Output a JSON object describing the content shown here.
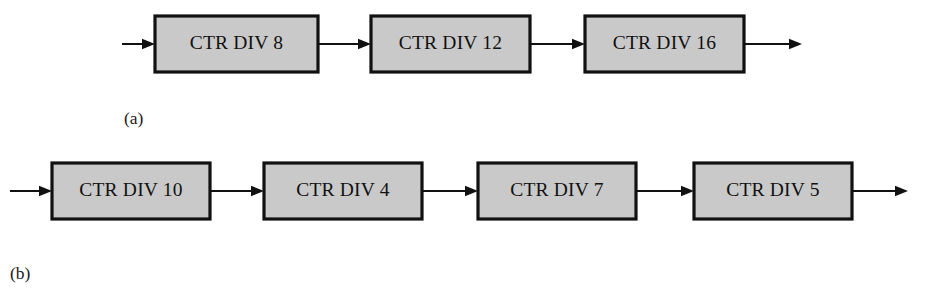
{
  "figure": {
    "background_color": "#ffffff",
    "block_fill_color": "#c9c9c9",
    "block_border_color": "#111111",
    "line_color": "#111111"
  },
  "panels": [
    {
      "caption": "(a)",
      "caption_x": 124,
      "caption_y": 120,
      "row_center_y": 44,
      "block_height": 56,
      "input_wire": {
        "x1": 122,
        "x2": 155
      },
      "output_wire": {
        "x1": 744,
        "x2": 802
      },
      "blocks": [
        {
          "label": "CTR DIV 8",
          "x": 155,
          "width": 163
        },
        {
          "label": "CTR DIV 12",
          "x": 371,
          "width": 159
        },
        {
          "label": "CTR DIV 16",
          "x": 585,
          "width": 159
        }
      ],
      "connectors": [
        {
          "x1": 318,
          "x2": 371
        },
        {
          "x1": 530,
          "x2": 585
        }
      ]
    },
    {
      "caption": "(b)",
      "caption_x": 10,
      "caption_y": 275,
      "row_center_y": 191,
      "block_height": 56,
      "input_wire": {
        "x1": 10,
        "x2": 52
      },
      "output_wire": {
        "x1": 852,
        "x2": 908
      },
      "blocks": [
        {
          "label": "CTR DIV 10",
          "x": 52,
          "width": 158
        },
        {
          "label": "CTR DIV 4",
          "x": 264,
          "width": 158
        },
        {
          "label": "CTR DIV 7",
          "x": 478,
          "width": 158
        },
        {
          "label": "CTR DIV 5",
          "x": 694,
          "width": 158
        }
      ],
      "connectors": [
        {
          "x1": 210,
          "x2": 264
        },
        {
          "x1": 422,
          "x2": 478
        },
        {
          "x1": 636,
          "x2": 694
        }
      ]
    }
  ]
}
